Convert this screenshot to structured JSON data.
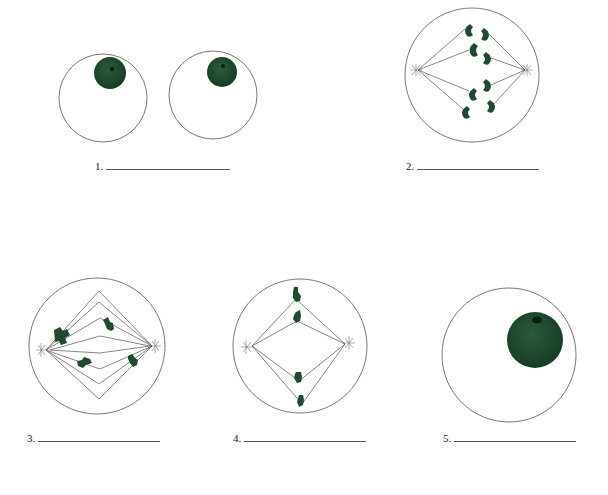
{
  "figure": {
    "title": "",
    "colors": {
      "membrane": "#555555",
      "chromatin": "#1f4a2f",
      "nucleolus": "#0d1f14",
      "spindle": "#555555"
    },
    "panels": [
      {
        "id": 1,
        "label": "1.",
        "answer": "",
        "description": "Two daughter cells, each with a nucleus"
      },
      {
        "id": 2,
        "label": "2.",
        "description": "Cell with chromatids pulled to opposite poles along spindle fibers"
      },
      {
        "id": 3,
        "label": "3.",
        "description": "Cell with spindle forming and scattered chromosomes"
      },
      {
        "id": 4,
        "label": "4.",
        "description": "Cell with chromosomes aligned on spindle"
      },
      {
        "id": 5,
        "label": "5.",
        "description": "Cell with large nucleus"
      }
    ]
  }
}
